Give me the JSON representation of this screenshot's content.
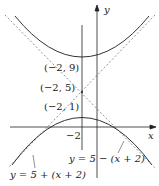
{
  "diagram": {
    "axes": {
      "x_label": "x",
      "y_label": "y"
    },
    "points": [
      {
        "label": "(−2, 9)"
      },
      {
        "label": "(−2, 5)"
      },
      {
        "label": "(−2, 1)"
      }
    ],
    "tick_label": "−2",
    "asymptotes": [
      {
        "label": "y = 5 − (x + 2)"
      },
      {
        "label": "y = 5 + (x + 2)"
      }
    ],
    "colors": {
      "curve": "#333333",
      "asymptote": "#777777",
      "axis": "#222222"
    }
  }
}
